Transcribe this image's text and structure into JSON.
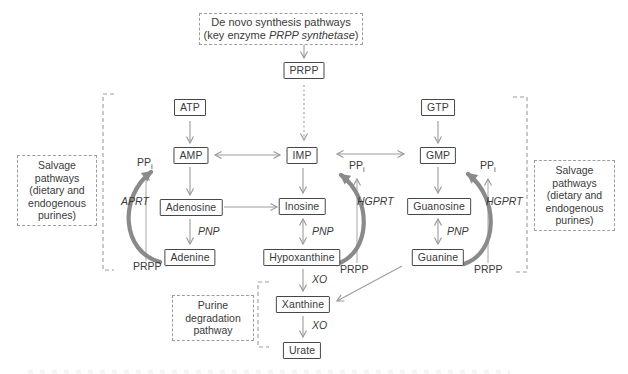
{
  "nodes": {
    "prpp": "PRPP",
    "atp": "ATP",
    "amp": "AMP",
    "imp": "IMP",
    "gtp": "GTP",
    "gmp": "GMP",
    "adenosine": "Adenosine",
    "inosine": "Inosine",
    "guanosine": "Guanosine",
    "adenine": "Adenine",
    "hypoxanthine": "Hypoxanthine",
    "guanine": "Guanine",
    "xanthine": "Xanthine",
    "urate": "Urate"
  },
  "notes": {
    "de_novo": {
      "line1": "De novo synthesis pathways",
      "line2_prefix": "(key enzyme ",
      "line2_italic": "PRPP synthetase",
      "line2_suffix": ")"
    },
    "salvage": "Salvage pathways\n(dietary and\nendogenous\npurines)",
    "degradation": "Purine\ndegradation\npathway"
  },
  "enzymes": {
    "aprt": "APRT",
    "hgprt": "HGPRT",
    "pnp": "PNP",
    "xo": "XO"
  },
  "metabolites": {
    "pp_base": "PP",
    "pp_sub": "i",
    "prpp": "PRPP"
  },
  "colors": {
    "box_border": "#474747",
    "text": "#3a3a3a",
    "arrow": "#9b9b9b",
    "thick_arrow": "#8a8a8a",
    "dashed_line": "#9d9d9d"
  }
}
